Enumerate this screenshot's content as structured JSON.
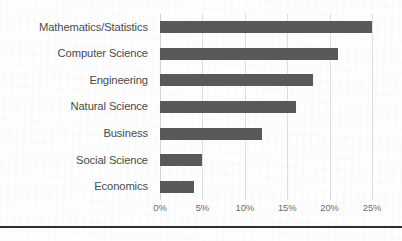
{
  "chart_data": {
    "type": "bar",
    "orientation": "horizontal",
    "title": "",
    "subtitle": "",
    "xlabel": "",
    "ylabel": "",
    "categories": [
      "Mathematics/Statistics",
      "Computer Science",
      "Engineering",
      "Natural Science",
      "Business",
      "Social Science",
      "Economics"
    ],
    "values": [
      25,
      21,
      18,
      16,
      12,
      5,
      4
    ],
    "value_unit": "%",
    "xlim": [
      0,
      25
    ],
    "xticks": [
      0,
      5,
      10,
      15,
      20,
      25
    ],
    "xtick_labels": [
      "0%",
      "5%",
      "10%",
      "15%",
      "20%",
      "25%"
    ],
    "grid": "vertical",
    "legend": "none",
    "bar_color": "#595959",
    "gridline_color": "#dedede",
    "label_color": "#4a4a4a",
    "tick_color": "#6b6b6b",
    "background_color": "#fefefe",
    "rule_color": "#2f2f2f"
  }
}
